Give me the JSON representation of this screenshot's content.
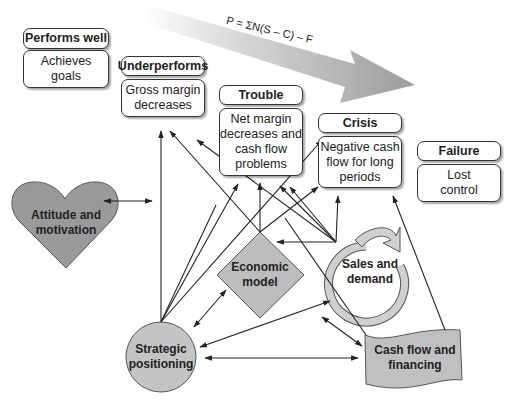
{
  "formula": "P = ΣN(S – C) – F",
  "stages": [
    {
      "title": "Performs well",
      "description": "Achieves goals"
    },
    {
      "title": "Underperforms",
      "description": "Gross margin decreases"
    },
    {
      "title": "Trouble",
      "description": "Net margin decreases and cash flow problems"
    },
    {
      "title": "Crisis",
      "description": "Negative cash flow for long periods"
    },
    {
      "title": "Failure",
      "description": "Lost control"
    }
  ],
  "factors": {
    "attitude": "Attitude and motivation",
    "economic_model": "Economic model",
    "sales": "Sales and demand",
    "strategic": "Strategic positioning",
    "cash_flow": "Cash flow and financing"
  },
  "stage_lines": {
    "performs_well": [
      "Achieves",
      "goals"
    ],
    "underperforms": [
      "Gross margin",
      "decreases"
    ],
    "trouble": [
      "Net margin",
      "decreases and",
      "cash flow",
      "problems"
    ],
    "crisis": [
      "Negative cash",
      "flow for long",
      "periods"
    ],
    "failure": [
      "Lost",
      "control"
    ]
  },
  "factor_lines": {
    "attitude": [
      "Attitude and",
      "motivation"
    ],
    "economic_model": [
      "Economic",
      "model"
    ],
    "sales": [
      "Sales and",
      "demand"
    ],
    "strategic": [
      "Strategic",
      "positioning"
    ],
    "cash_flow": [
      "Cash flow and",
      "financing"
    ]
  },
  "colors": {
    "shape_fill": "#bdbdbd",
    "heart_fill": "#9a9a9a",
    "arrow_band": "#a8a8a8",
    "line": "#222222"
  }
}
